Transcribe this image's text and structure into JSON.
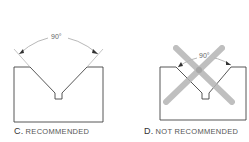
{
  "figures": [
    {
      "id": "C",
      "letter": "C.",
      "caption": "RECOMMENDED",
      "angle_label": "90°",
      "crossed_out": false
    },
    {
      "id": "D",
      "letter": "D.",
      "caption": "NOT RECOMMENDED",
      "angle_label": "90°",
      "crossed_out": true
    }
  ],
  "colors": {
    "outline": "#444444",
    "dimension": "#999999",
    "cross": "#b5b5b5"
  }
}
